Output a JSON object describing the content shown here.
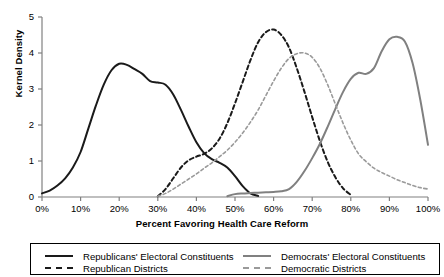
{
  "chart_data": {
    "type": "line",
    "title": "",
    "xlabel": "Percent Favoring Health Care Reform",
    "ylabel": "Kernel Density",
    "xlim": [
      0,
      100
    ],
    "ylim": [
      0,
      5
    ],
    "grid": false,
    "legend_position": "bottom",
    "xticks": [
      "0%",
      "10%",
      "20%",
      "30%",
      "40%",
      "50%",
      "60%",
      "70%",
      "80%",
      "90%",
      "100%"
    ],
    "xtick_values": [
      0,
      10,
      20,
      30,
      40,
      50,
      60,
      70,
      80,
      90,
      100
    ],
    "yticks": [
      "0",
      "1",
      "2",
      "3",
      "4",
      "5"
    ],
    "ytick_values": [
      0,
      1,
      2,
      3,
      4,
      5
    ],
    "series": [
      {
        "name": "Republicans' Electoral Constituents",
        "color": "#1a1a1a",
        "style": "solid",
        "width": 2.0,
        "x": [
          0,
          2,
          4,
          6,
          8,
          10,
          12,
          14,
          16,
          18,
          20,
          22,
          24,
          26,
          28,
          30,
          32,
          34,
          36,
          38,
          40,
          42,
          44,
          46,
          48,
          50,
          52,
          54,
          56
        ],
        "y": [
          0.1,
          0.18,
          0.32,
          0.52,
          0.82,
          1.25,
          1.9,
          2.55,
          3.12,
          3.52,
          3.7,
          3.67,
          3.55,
          3.42,
          3.22,
          3.18,
          3.12,
          2.85,
          2.42,
          1.95,
          1.52,
          1.22,
          1.05,
          0.95,
          0.82,
          0.58,
          0.3,
          0.1,
          0.03
        ]
      },
      {
        "name": "Republican Districts",
        "color": "#1a1a1a",
        "style": "dashed",
        "width": 2.0,
        "x": [
          30,
          32,
          34,
          36,
          38,
          40,
          42,
          44,
          46,
          48,
          50,
          52,
          54,
          56,
          58,
          60,
          62,
          64,
          66,
          68,
          70,
          72,
          74,
          76,
          78,
          80
        ],
        "y": [
          0.02,
          0.22,
          0.52,
          0.82,
          1.02,
          1.12,
          1.2,
          1.35,
          1.62,
          2.05,
          2.6,
          3.2,
          3.8,
          4.3,
          4.58,
          4.65,
          4.5,
          4.15,
          3.58,
          2.92,
          2.22,
          1.55,
          0.98,
          0.55,
          0.24,
          0.06
        ]
      },
      {
        "name": "Democrats' Electoral Constituents",
        "color": "#808080",
        "style": "solid",
        "width": 2.0,
        "x": [
          48,
          50,
          52,
          54,
          56,
          58,
          60,
          62,
          64,
          66,
          68,
          70,
          72,
          74,
          76,
          78,
          80,
          82,
          84,
          86,
          88,
          90,
          92,
          94,
          96,
          98,
          100
        ],
        "y": [
          0.02,
          0.08,
          0.1,
          0.11,
          0.12,
          0.13,
          0.14,
          0.16,
          0.22,
          0.42,
          0.72,
          1.08,
          1.48,
          1.95,
          2.45,
          2.92,
          3.28,
          3.45,
          3.42,
          3.58,
          4.05,
          4.38,
          4.45,
          4.32,
          3.72,
          2.7,
          1.45
        ]
      },
      {
        "name": "Democratic Districts",
        "color": "#9a9a9a",
        "style": "dashed",
        "width": 1.6,
        "x": [
          30,
          32,
          34,
          36,
          38,
          40,
          42,
          44,
          46,
          48,
          50,
          52,
          54,
          56,
          58,
          60,
          62,
          64,
          66,
          68,
          70,
          72,
          74,
          76,
          78,
          80,
          82,
          84,
          86,
          88,
          90,
          92,
          94,
          96,
          98,
          100
        ],
        "y": [
          0.02,
          0.1,
          0.22,
          0.36,
          0.5,
          0.64,
          0.8,
          0.95,
          1.12,
          1.3,
          1.52,
          1.78,
          2.08,
          2.42,
          2.82,
          3.22,
          3.58,
          3.85,
          3.98,
          4.0,
          3.88,
          3.58,
          3.12,
          2.58,
          2.05,
          1.58,
          1.2,
          0.98,
          0.8,
          0.68,
          0.58,
          0.48,
          0.4,
          0.32,
          0.26,
          0.22
        ]
      }
    ],
    "legend": [
      {
        "label": "Republicans' Electoral Constituents",
        "color": "#1a1a1a",
        "style": "solid"
      },
      {
        "label": "Democrats' Electoral Constituents",
        "color": "#808080",
        "style": "solid"
      },
      {
        "label": "Republican Districts",
        "color": "#1a1a1a",
        "style": "dashed"
      },
      {
        "label": "Democratic Districts",
        "color": "#9a9a9a",
        "style": "dashed"
      }
    ]
  }
}
